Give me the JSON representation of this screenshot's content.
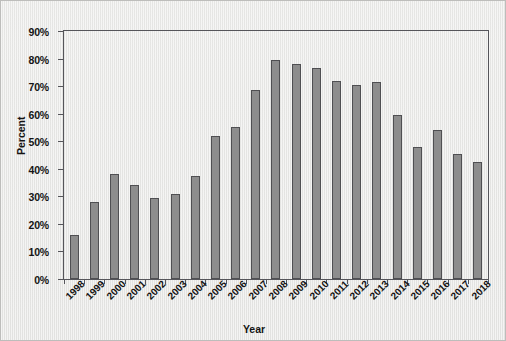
{
  "chart_data": {
    "type": "bar",
    "title": "",
    "xlabel": "Year",
    "ylabel": "Percent",
    "categories": [
      "1998",
      "1999",
      "2000",
      "2001",
      "2002",
      "2003",
      "2004",
      "2005",
      "2006",
      "2007",
      "2008",
      "2009",
      "2010",
      "2011",
      "2012",
      "2013",
      "2014",
      "2015",
      "2016",
      "2017",
      "2018"
    ],
    "values": [
      16,
      28,
      38,
      34,
      29.5,
      31,
      37.5,
      52,
      55,
      68.5,
      79.5,
      78,
      76.5,
      72,
      70.5,
      71.5,
      59.5,
      48,
      54,
      45.5,
      42.5
    ],
    "ylim": [
      0,
      90
    ],
    "ytick_labels": [
      "90%",
      "80%",
      "70%",
      "60%",
      "50%",
      "40%",
      "30%",
      "20%",
      "10%",
      "0%"
    ],
    "ytick_values": [
      90,
      80,
      70,
      60,
      50,
      40,
      30,
      20,
      10,
      0
    ],
    "grid": false,
    "legend": "none",
    "series": [
      {
        "name": "Percent",
        "values": [
          16,
          28,
          38,
          34,
          29.5,
          31,
          37.5,
          52,
          55,
          68.5,
          79.5,
          78,
          76.5,
          72,
          70.5,
          71.5,
          59.5,
          48,
          54,
          45.5,
          42.5
        ]
      }
    ],
    "colors": {
      "bar_fill": "#8d8d8d",
      "bar_edge": "#4f4f52",
      "frame": "#55555a",
      "background": "#e8e8e6",
      "text": "#141414"
    }
  }
}
